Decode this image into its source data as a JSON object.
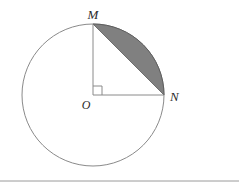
{
  "figure": {
    "background_color": "#ffffff",
    "labels": {
      "center": "O",
      "top_point": "M",
      "right_point": "N"
    },
    "geometry": {
      "center_x": 93,
      "center_y": 95,
      "radius": 71,
      "point_m_x": 93,
      "point_m_y": 24,
      "point_n_x": 164,
      "point_n_y": 95,
      "central_angle_degrees": 90,
      "right_angle_marker_size": 9
    },
    "colors": {
      "circle_outline": "#8a8a8a",
      "radius_line": "#8a8a8a",
      "chord_line": "#6f6f6f",
      "shaded_segment_fill": "#808080",
      "shaded_segment_stroke": "#5e5e5e",
      "label_text": "#2b2b2b",
      "separator_rule": "#9a9a9a"
    },
    "separator": {
      "y": 181,
      "x_start": 0,
      "x_end": 239
    }
  }
}
